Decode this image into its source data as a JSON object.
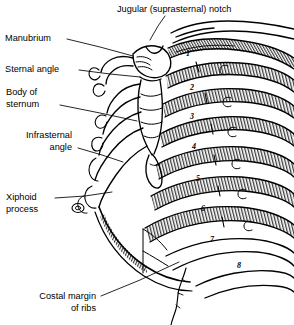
{
  "figure": {
    "background_color": "#ffffff",
    "ink_color": "#000000",
    "width": 294,
    "height": 325
  },
  "labels": [
    {
      "id": "jugular-notch",
      "text": "Jugular (suprasternal) notch",
      "align": "left",
      "x": 117,
      "y": 4,
      "leader": [
        [
          165,
          16
        ],
        [
          158,
          26
        ],
        [
          150,
          40
        ]
      ]
    },
    {
      "id": "manubrium",
      "text": "Manubrium",
      "align": "left",
      "x": 5,
      "y": 33,
      "leader": [
        [
          67,
          39
        ],
        [
          100,
          47
        ],
        [
          133,
          56
        ]
      ]
    },
    {
      "id": "sternal-angle",
      "text": "Sternal angle",
      "align": "left",
      "x": 5,
      "y": 64,
      "leader": [
        [
          79,
          70
        ],
        [
          110,
          74
        ],
        [
          140,
          77
        ]
      ]
    },
    {
      "id": "body-of-sternum",
      "text": "Body of\nsternum",
      "align": "left",
      "x": 6,
      "y": 87,
      "leader": [
        [
          60,
          105
        ],
        [
          100,
          113
        ],
        [
          137,
          121
        ]
      ]
    },
    {
      "id": "infrasternal-angle",
      "text": "Infrasternal\nangle",
      "align": "right",
      "x": 4,
      "y": 130,
      "width": 68,
      "leader": [
        [
          78,
          148
        ],
        [
          102,
          155
        ],
        [
          123,
          162
        ]
      ]
    },
    {
      "id": "xiphoid-process",
      "text": "Xiphoid\nprocess",
      "align": "left",
      "x": 6,
      "y": 192,
      "leader": [
        [
          55,
          198
        ],
        [
          85,
          196
        ],
        [
          112,
          192
        ]
      ]
    },
    {
      "id": "costal-margin",
      "text": "Costal margin\nof ribs",
      "align": "right",
      "x": 12,
      "y": 291,
      "width": 84,
      "leader": [
        [
          101,
          296
        ],
        [
          140,
          280
        ],
        [
          179,
          262
        ]
      ]
    }
  ],
  "rib_numbers": [
    {
      "number": "1",
      "x": 186,
      "y": 50
    },
    {
      "number": "2",
      "x": 190,
      "y": 84
    },
    {
      "number": "3",
      "x": 190,
      "y": 113
    },
    {
      "number": "4",
      "x": 192,
      "y": 143
    },
    {
      "number": "5",
      "x": 196,
      "y": 175
    },
    {
      "number": "6",
      "x": 201,
      "y": 205
    },
    {
      "number": "7",
      "x": 210,
      "y": 236
    },
    {
      "number": "8",
      "x": 237,
      "y": 262
    }
  ]
}
